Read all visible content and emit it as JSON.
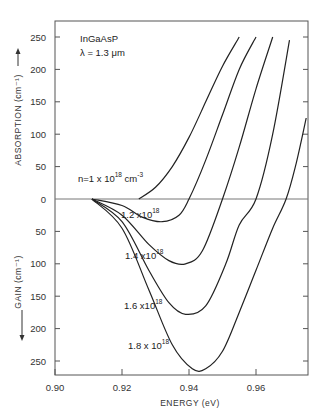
{
  "chart_data": {
    "type": "line",
    "title": "",
    "annotation_lines": [
      "InGaAsP",
      "λ = 1.3 μm"
    ],
    "xlabel": "ENERGY (eV)",
    "ylabel_top": "ABSORPTION (cm⁻¹)",
    "ylabel_bottom": "GAIN (cm⁻¹)",
    "xlim": [
      0.9,
      0.975
    ],
    "ylim": [
      -265,
      270
    ],
    "x_ticks": [
      0.9,
      0.92,
      0.94,
      0.96
    ],
    "x_tick_labels": [
      "0.90",
      "0.92",
      "0.94",
      "0.96"
    ],
    "y_ticks": [
      250,
      200,
      150,
      100,
      50,
      0,
      -50,
      -100,
      -150,
      -200,
      -250
    ],
    "y_tick_labels": [
      "250",
      "200",
      "150",
      "100",
      "50",
      "0",
      "50",
      "100",
      "150",
      "200",
      "250"
    ],
    "zero_line": true,
    "grid": false,
    "legend": "inline labels",
    "series": [
      {
        "name": "n = 1 x 10^18 cm^-3",
        "label_main": "n=1 x 10",
        "label_sup": "18",
        "label_unit": " cm",
        "label_unit_sup": "-3",
        "x": [
          0.925,
          0.93,
          0.935,
          0.94,
          0.945,
          0.95,
          0.955
        ],
        "y": [
          0,
          18,
          50,
          95,
          150,
          205,
          250
        ]
      },
      {
        "name": "1.2 x 10^18",
        "label_main": "1.2 x10",
        "label_sup": "18",
        "x": [
          0.911,
          0.92,
          0.926,
          0.932,
          0.937,
          0.94,
          0.945,
          0.95,
          0.955,
          0.96
        ],
        "y": [
          0,
          -10,
          -28,
          -35,
          -25,
          0,
          60,
          130,
          200,
          250
        ]
      },
      {
        "name": "1.4 x 10^18",
        "label_main": "1.4 x10",
        "label_sup": "18",
        "x": [
          0.911,
          0.92,
          0.928,
          0.934,
          0.939,
          0.944,
          0.95,
          0.955,
          0.96,
          0.965
        ],
        "y": [
          0,
          -25,
          -70,
          -95,
          -100,
          -80,
          0,
          80,
          170,
          250
        ]
      },
      {
        "name": "1.6 x 10^18",
        "label_main": "1.6 x10",
        "label_sup": "18",
        "x": [
          0.911,
          0.92,
          0.928,
          0.934,
          0.939,
          0.945,
          0.951,
          0.955,
          0.96,
          0.965,
          0.97
        ],
        "y": [
          0,
          -35,
          -110,
          -160,
          -178,
          -165,
          -100,
          -40,
          0,
          100,
          245
        ]
      },
      {
        "name": "1.8 x 10^18",
        "label_main": "1.8 x 10",
        "label_sup": "18",
        "x": [
          0.911,
          0.92,
          0.928,
          0.935,
          0.941,
          0.945,
          0.95,
          0.955,
          0.96,
          0.965,
          0.969,
          0.972,
          0.975
        ],
        "y": [
          0,
          -45,
          -140,
          -225,
          -262,
          -262,
          -235,
          -175,
          -110,
          -45,
          0,
          55,
          125
        ]
      }
    ]
  }
}
